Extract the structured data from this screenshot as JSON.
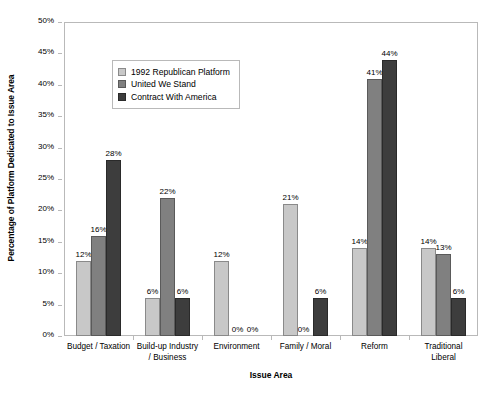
{
  "chart_data": {
    "type": "bar",
    "title": "",
    "xlabel": "Issue Area",
    "ylabel": "Percentage of Platform Dedicated to Issue Area",
    "ylim": [
      0,
      50
    ],
    "y_tick_labels": [
      "0%",
      "5%",
      "10%",
      "15%",
      "20%",
      "25%",
      "30%",
      "35%",
      "40%",
      "45%",
      "50%"
    ],
    "y_tick_values": [
      0,
      5,
      10,
      15,
      20,
      25,
      30,
      35,
      40,
      45,
      50
    ],
    "grid": false,
    "legend_position": "upper-left-inside",
    "categories": [
      "Budget / Taxation",
      "Build-up Industry / Business",
      "Environment",
      "Family / Moral",
      "Reform",
      "Traditional Liberal"
    ],
    "category_lines": [
      [
        "Budget / Taxation"
      ],
      [
        "Build-up Industry",
        "/ Business"
      ],
      [
        "Environment"
      ],
      [
        "Family / Moral"
      ],
      [
        "Reform"
      ],
      [
        "Traditional",
        "Liberal"
      ]
    ],
    "series": [
      {
        "name": "1992 Republican Platform",
        "color": "#c8c8c8",
        "values": [
          12,
          6,
          12,
          21,
          14,
          14
        ],
        "labels": [
          "12%",
          "6%",
          "12%",
          "21%",
          "14%",
          "14%"
        ]
      },
      {
        "name": "United We Stand",
        "color": "#808080",
        "values": [
          16,
          22,
          0,
          0,
          41,
          13
        ],
        "labels": [
          "16%",
          "22%",
          "0%",
          "0%",
          "41%",
          "13%"
        ]
      },
      {
        "name": "Contract With America",
        "color": "#3d3d3d",
        "values": [
          28,
          6,
          0,
          6,
          44,
          6
        ],
        "labels": [
          "28%",
          "6%",
          "0%",
          "6%",
          "44%",
          "6%"
        ]
      }
    ]
  }
}
